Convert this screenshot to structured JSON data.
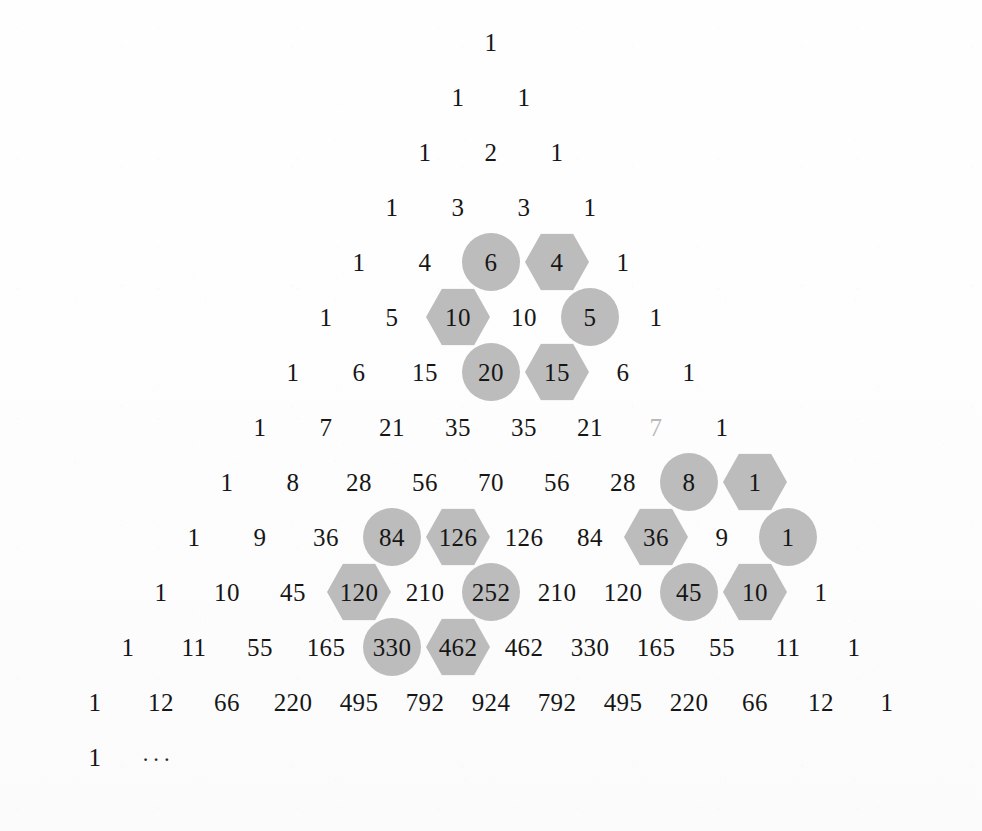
{
  "figure": {
    "background_color": "#fefefe",
    "text_color": "#161616",
    "highlight_color": "#bcbcbc",
    "row_step_px": 55,
    "col_step_px": 66,
    "center_x_px": 491,
    "first_row_y_px": 42
  },
  "chart_data": {
    "type": "table",
    "xlabel": "",
    "ylabel": "",
    "grid": false,
    "legend": [
      {
        "name": "circle-highlight",
        "shape": "circle",
        "color": "#bcbcbc"
      },
      {
        "name": "hexagon-highlight",
        "shape": "hexagon",
        "color": "#bcbcbc"
      }
    ],
    "rows": [
      {
        "index": 0,
        "values": [
          1
        ]
      },
      {
        "index": 1,
        "values": [
          1,
          1
        ]
      },
      {
        "index": 2,
        "values": [
          1,
          2,
          1
        ]
      },
      {
        "index": 3,
        "values": [
          1,
          3,
          3,
          1
        ]
      },
      {
        "index": 4,
        "values": [
          1,
          4,
          6,
          4,
          1
        ]
      },
      {
        "index": 5,
        "values": [
          1,
          5,
          10,
          10,
          5,
          1
        ]
      },
      {
        "index": 6,
        "values": [
          1,
          6,
          15,
          20,
          15,
          6,
          1
        ]
      },
      {
        "index": 7,
        "values": [
          1,
          7,
          21,
          35,
          35,
          21,
          7,
          1
        ]
      },
      {
        "index": 8,
        "values": [
          1,
          8,
          28,
          56,
          70,
          56,
          28,
          8,
          1
        ]
      },
      {
        "index": 9,
        "values": [
          1,
          9,
          36,
          84,
          126,
          126,
          84,
          36,
          9,
          1
        ]
      },
      {
        "index": 10,
        "values": [
          1,
          10,
          45,
          120,
          210,
          252,
          210,
          120,
          45,
          10,
          1
        ]
      },
      {
        "index": 11,
        "values": [
          1,
          11,
          55,
          165,
          330,
          462,
          462,
          330,
          165,
          55,
          11,
          1
        ]
      },
      {
        "index": 12,
        "values": [
          1,
          12,
          66,
          220,
          495,
          792,
          924,
          792,
          495,
          220,
          66,
          12,
          1
        ]
      }
    ],
    "continuation_row": {
      "index": 13,
      "values": [
        "1",
        "···"
      ]
    },
    "highlights": [
      {
        "row": 4,
        "col": 2,
        "value": 6,
        "shape": "circle"
      },
      {
        "row": 4,
        "col": 3,
        "value": 4,
        "shape": "hexagon"
      },
      {
        "row": 5,
        "col": 2,
        "value": 10,
        "shape": "hexagon"
      },
      {
        "row": 5,
        "col": 4,
        "value": 5,
        "shape": "circle"
      },
      {
        "row": 6,
        "col": 3,
        "value": 20,
        "shape": "circle"
      },
      {
        "row": 6,
        "col": 4,
        "value": 15,
        "shape": "hexagon"
      },
      {
        "row": 8,
        "col": 7,
        "value": 8,
        "shape": "circle"
      },
      {
        "row": 8,
        "col": 8,
        "value": 1,
        "shape": "hexagon"
      },
      {
        "row": 9,
        "col": 3,
        "value": 84,
        "shape": "circle"
      },
      {
        "row": 9,
        "col": 4,
        "value": 126,
        "shape": "hexagon"
      },
      {
        "row": 9,
        "col": 7,
        "value": 36,
        "shape": "hexagon"
      },
      {
        "row": 9,
        "col": 9,
        "value": 1,
        "shape": "circle"
      },
      {
        "row": 10,
        "col": 3,
        "value": 120,
        "shape": "hexagon"
      },
      {
        "row": 10,
        "col": 5,
        "value": 252,
        "shape": "circle"
      },
      {
        "row": 10,
        "col": 8,
        "value": 45,
        "shape": "circle"
      },
      {
        "row": 10,
        "col": 9,
        "value": 10,
        "shape": "hexagon"
      },
      {
        "row": 11,
        "col": 4,
        "value": 330,
        "shape": "circle"
      },
      {
        "row": 11,
        "col": 5,
        "value": 462,
        "shape": "hexagon"
      }
    ],
    "faded_cells": [
      {
        "row": 7,
        "col": 6,
        "value": 7
      }
    ]
  }
}
